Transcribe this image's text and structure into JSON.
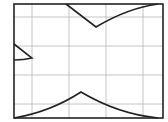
{
  "diagram": {
    "type": "curve-plot-grid",
    "width": 168,
    "height": 122,
    "frame": {
      "x": 14,
      "y": 4,
      "w": 149,
      "h": 114,
      "stroke": "#222222",
      "stroke_width": 1.6
    },
    "grid": {
      "stroke": "#b5b5b5",
      "stroke_width": 0.8,
      "vertical_x": [
        32,
        69,
        106,
        143
      ],
      "horizontal_y": [
        17,
        46,
        75,
        104
      ]
    },
    "curves": [
      {
        "name": "top-cusp-curve",
        "stroke": "#222222",
        "stroke_width": 1.6,
        "d": "M66,4 L96,27 Q128,8 158,4"
      },
      {
        "name": "left-cusp-curve",
        "stroke": "#222222",
        "stroke_width": 1.6,
        "d": "M14,44 L32,58 Q24,60 14,60"
      },
      {
        "name": "bottom-cusp-curve",
        "stroke": "#222222",
        "stroke_width": 1.6,
        "d": "M14,118 Q50,112 81,92 Q118,114 158,118"
      }
    ]
  }
}
